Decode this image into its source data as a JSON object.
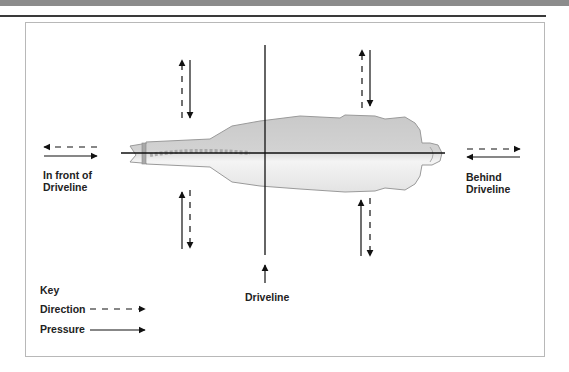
{
  "figure": {
    "labels": {
      "front": "In front of\nDriveline",
      "behind": "Behind\nDriveline",
      "driveline": "Driveline"
    },
    "key": {
      "title": "Key",
      "direction": "Direction",
      "pressure": "Pressure"
    },
    "colors": {
      "body_fill": "#cfcfcf",
      "body_shade": "#f2f2f2",
      "body_outline": "#9a9a9a",
      "line": "#111111",
      "frame_border": "#b8b8b8",
      "top_bar": "#8c8c8c"
    }
  }
}
